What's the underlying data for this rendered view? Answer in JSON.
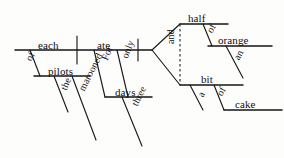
{
  "diagram": {
    "type": "reed-kellogg-sentence-diagram",
    "sentence": "Each of the marooned pilots ate only three days for half of an orange and a bit of cake.",
    "ink_color": "#141414",
    "background_color": "#fdfdfc",
    "canvas": {
      "width": 284,
      "height": 158
    },
    "nodes": [
      {
        "id": "subject",
        "label": "each",
        "role": "subject",
        "x": 38,
        "y": 40,
        "rotation": 0
      },
      {
        "id": "verb",
        "label": "ate",
        "role": "verb",
        "x": 97,
        "y": 40,
        "rotation": 0
      },
      {
        "id": "prep-of-1",
        "label": "of",
        "role": "preposition",
        "x": 24,
        "y": 58,
        "rotation": -62
      },
      {
        "id": "obj-pilots",
        "label": "pilots",
        "role": "object-of-preposition",
        "x": 48,
        "y": 66,
        "rotation": 0
      },
      {
        "id": "mod-the",
        "label": "the",
        "role": "article",
        "x": 59,
        "y": 88,
        "rotation": -68
      },
      {
        "id": "mod-marooned",
        "label": "marooned",
        "role": "adjective",
        "x": 77,
        "y": 88,
        "rotation": -63
      },
      {
        "id": "prep-for",
        "label": "For",
        "role": "preposition",
        "x": 100,
        "y": 58,
        "rotation": -68
      },
      {
        "id": "mod-only",
        "label": "only",
        "role": "adverb",
        "x": 120,
        "y": 56,
        "rotation": -68
      },
      {
        "id": "obj-days",
        "label": "days",
        "role": "object",
        "x": 115,
        "y": 87,
        "rotation": 0
      },
      {
        "id": "mod-three",
        "label": "three",
        "role": "numeral-adjective",
        "x": 130,
        "y": 103,
        "rotation": -63
      },
      {
        "id": "conj-and",
        "label": "and",
        "role": "conjunction",
        "x": 166,
        "y": 44,
        "rotation": -90
      },
      {
        "id": "obj-half",
        "label": "half",
        "role": "object-of-preposition",
        "x": 188,
        "y": 13,
        "rotation": 0
      },
      {
        "id": "prep-of-2",
        "label": "of",
        "role": "preposition",
        "x": 205,
        "y": 30,
        "rotation": -62
      },
      {
        "id": "obj-orange",
        "label": "orange",
        "role": "object-of-preposition",
        "x": 218,
        "y": 35,
        "rotation": 0
      },
      {
        "id": "mod-an",
        "label": "an",
        "role": "article",
        "x": 232,
        "y": 57,
        "rotation": -62
      },
      {
        "id": "obj-bit",
        "label": "bit",
        "role": "object-of-preposition",
        "x": 201,
        "y": 74,
        "rotation": 0
      },
      {
        "id": "mod-a",
        "label": "a",
        "role": "article",
        "x": 196,
        "y": 94,
        "rotation": -62
      },
      {
        "id": "prep-of-3",
        "label": "of",
        "role": "preposition",
        "x": 215,
        "y": 93,
        "rotation": -62
      },
      {
        "id": "obj-cake",
        "label": "cake",
        "role": "object-of-preposition",
        "x": 235,
        "y": 99,
        "rotation": 0
      }
    ],
    "strokes": [
      {
        "id": "main-baseline",
        "kind": "baseline",
        "points": "15,50 152,50"
      },
      {
        "id": "subject-verb-divider",
        "kind": "vertical-divider",
        "points": "77,36 77,64"
      },
      {
        "id": "verb-complement-divider",
        "kind": "vertical-divider",
        "points": "138,39 138,61"
      },
      {
        "id": "prep-of-1-slant",
        "kind": "slant",
        "points": "30,50 40,76"
      },
      {
        "id": "pilots-baseline",
        "kind": "baseline",
        "points": "34,76 90,76"
      },
      {
        "id": "the-slant",
        "kind": "slant",
        "points": "54,76 68,112"
      },
      {
        "id": "marooned-slant",
        "kind": "slant",
        "points": "72,76 96,140"
      },
      {
        "id": "for-slant",
        "kind": "slant",
        "points": "94,50 105,97"
      },
      {
        "id": "only-slant",
        "kind": "slant",
        "points": "117,50 128,97"
      },
      {
        "id": "days-baseline",
        "kind": "baseline",
        "points": "105,97 152,97"
      },
      {
        "id": "three-slant",
        "kind": "slant",
        "points": "122,97 142,146"
      },
      {
        "id": "fork-upper",
        "kind": "fork",
        "points": "152,50 180,24"
      },
      {
        "id": "fork-lower",
        "kind": "fork",
        "points": "152,50 180,85"
      },
      {
        "id": "conjunction-dashed",
        "kind": "dashed",
        "points": "180,24 180,85"
      },
      {
        "id": "half-baseline",
        "kind": "baseline",
        "points": "180,24 228,24"
      },
      {
        "id": "prep-of-2-slant",
        "kind": "slant",
        "points": "203,24 212,46"
      },
      {
        "id": "orange-baseline",
        "kind": "baseline",
        "points": "208,46 272,46"
      },
      {
        "id": "an-slant",
        "kind": "slant",
        "points": "226,46 243,78"
      },
      {
        "id": "bit-baseline",
        "kind": "baseline",
        "points": "180,85 243,85"
      },
      {
        "id": "a-slant",
        "kind": "slant",
        "points": "190,85 203,110"
      },
      {
        "id": "prep-of-3-slant",
        "kind": "slant",
        "points": "214,85 224,110"
      },
      {
        "id": "cake-baseline",
        "kind": "baseline",
        "points": "224,110 282,110"
      }
    ]
  }
}
